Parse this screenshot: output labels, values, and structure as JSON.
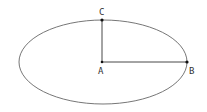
{
  "diagram": {
    "type": "ellipse-geometry",
    "ellipse": {
      "cx": 103,
      "cy": 62,
      "rx": 84,
      "ry": 42,
      "stroke": "#666666"
    },
    "points": [
      {
        "id": "A",
        "label": "A",
        "x": 102,
        "y": 62,
        "label_x": 98,
        "label_y": 74
      },
      {
        "id": "B",
        "label": "B",
        "x": 187,
        "y": 62,
        "label_x": 189,
        "label_y": 74
      },
      {
        "id": "C",
        "label": "C",
        "x": 102,
        "y": 20,
        "label_x": 99,
        "label_y": 15
      }
    ],
    "segments": [
      {
        "from": "A",
        "to": "B",
        "name": "semi-major-axis"
      },
      {
        "from": "A",
        "to": "C",
        "name": "semi-minor-axis"
      }
    ]
  }
}
